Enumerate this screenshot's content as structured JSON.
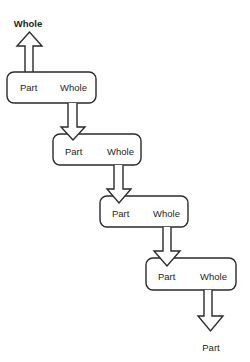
{
  "diagram": {
    "top_label": "Whole",
    "bottom_label": "Part",
    "boxes": [
      {
        "part_label": "Part",
        "whole_label": "Whole"
      },
      {
        "part_label": "Part",
        "whole_label": "Whole"
      },
      {
        "part_label": "Part",
        "whole_label": "Whole"
      },
      {
        "part_label": "Part",
        "whole_label": "Whole"
      }
    ],
    "colors": {
      "stroke": "#2a2a2a",
      "fill": "#ffffff",
      "text": "#1e1e1e"
    }
  }
}
